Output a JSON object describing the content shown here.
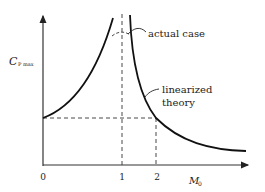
{
  "diagram": {
    "y_axis_label": "C",
    "y_axis_subscript": "P max",
    "x_axis_label": "M",
    "x_axis_subscript": "0",
    "x_ticks": [
      "0",
      "1",
      "2"
    ],
    "annotations": {
      "actual": "actual case",
      "linear_line1": "linearized",
      "linear_line2": "theory"
    },
    "colors": {
      "ink": "#111111",
      "background": "#ffffff"
    }
  }
}
